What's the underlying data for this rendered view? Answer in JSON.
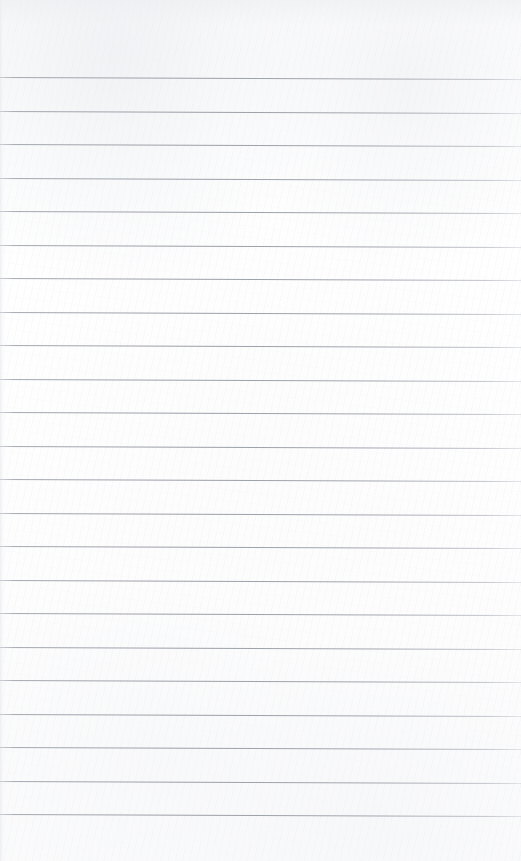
{
  "document": {
    "type": "lined-notebook-page",
    "title": "Blank ruled notebook page",
    "description": "Scanned blank sheet of ruled (lined) notebook paper with no handwriting or printed text.",
    "page_width": 521,
    "page_height": 861,
    "paper_color": "#fdfdfd",
    "rule_color": "#9aa0a8",
    "rule_thickness_px": 1,
    "has_margin_line": false,
    "has_header_text": false,
    "has_page_number": false,
    "top_margin_px": 77,
    "rule_spacing_px": 33.5,
    "rule_skew_deg": 0.22,
    "rule_count": 23,
    "rule_positions_y": [
      77,
      110.5,
      144,
      177.5,
      211,
      244.5,
      278,
      311.5,
      345,
      378.5,
      412,
      445.5,
      479,
      512.5,
      546,
      579.5,
      613,
      646.5,
      680,
      713.5,
      747,
      780.5,
      814
    ],
    "rule_lines": [
      {
        "index": 1,
        "y": 77,
        "text": ""
      },
      {
        "index": 2,
        "y": 110.5,
        "text": ""
      },
      {
        "index": 3,
        "y": 144,
        "text": ""
      },
      {
        "index": 4,
        "y": 177.5,
        "text": ""
      },
      {
        "index": 5,
        "y": 211,
        "text": ""
      },
      {
        "index": 6,
        "y": 244.5,
        "text": ""
      },
      {
        "index": 7,
        "y": 278,
        "text": ""
      },
      {
        "index": 8,
        "y": 311.5,
        "text": ""
      },
      {
        "index": 9,
        "y": 345,
        "text": ""
      },
      {
        "index": 10,
        "y": 378.5,
        "text": ""
      },
      {
        "index": 11,
        "y": 412,
        "text": ""
      },
      {
        "index": 12,
        "y": 445.5,
        "text": ""
      },
      {
        "index": 13,
        "y": 479,
        "text": ""
      },
      {
        "index": 14,
        "y": 512.5,
        "text": ""
      },
      {
        "index": 15,
        "y": 546,
        "text": ""
      },
      {
        "index": 16,
        "y": 579.5,
        "text": ""
      },
      {
        "index": 17,
        "y": 613,
        "text": ""
      },
      {
        "index": 18,
        "y": 646.5,
        "text": ""
      },
      {
        "index": 19,
        "y": 680,
        "text": ""
      },
      {
        "index": 20,
        "y": 713.5,
        "text": ""
      },
      {
        "index": 21,
        "y": 747,
        "text": ""
      },
      {
        "index": 22,
        "y": 780.5,
        "text": ""
      },
      {
        "index": 23,
        "y": 814,
        "text": ""
      }
    ]
  }
}
